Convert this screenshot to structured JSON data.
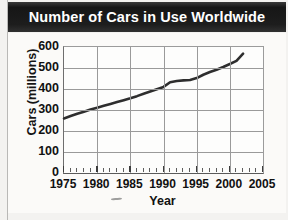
{
  "page": {
    "background_color": "#f3f2f0",
    "card_color": "#fbfaf8"
  },
  "banner": {
    "title": "Number of Cars in Use Worldwide",
    "background_color": "#1b1b1b",
    "text_color": "#ffffff"
  },
  "chart_data": {
    "type": "line",
    "title": "Number of Cars in Use Worldwide",
    "xlabel": "Year",
    "ylabel": "Cars (millions)",
    "xlim": [
      1975,
      2005
    ],
    "ylim": [
      0,
      600
    ],
    "xticks": [
      1975,
      1980,
      1985,
      1990,
      1995,
      2000,
      2005
    ],
    "xtick_labels": [
      "1975",
      "1980",
      "1985",
      "1990",
      "1995",
      "2000",
      "2005"
    ],
    "yticks": [
      0,
      100,
      200,
      300,
      400,
      500,
      600
    ],
    "ytick_labels": [
      "0",
      "100",
      "200",
      "300",
      "400",
      "500",
      "600"
    ],
    "minor_xtick_interval": 1,
    "grid": "both",
    "legend": "none",
    "line_color": "#2e2e2e",
    "line_width": 2.6,
    "series": [
      {
        "name": "Cars in use worldwide (millions)",
        "x": [
          1975,
          1976,
          1977,
          1978,
          1979,
          1980,
          1981,
          1982,
          1983,
          1984,
          1985,
          1986,
          1987,
          1988,
          1989,
          1990,
          1991,
          1992,
          1993,
          1994,
          1995,
          1996,
          1997,
          1998,
          1999,
          2000,
          2001,
          2002
        ],
        "values": [
          260,
          271,
          282,
          292,
          302,
          311,
          320,
          329,
          338,
          347,
          356,
          366,
          377,
          388,
          399,
          410,
          432,
          438,
          441,
          443,
          452,
          468,
          481,
          492,
          505,
          519,
          534,
          568
        ]
      }
    ],
    "annotations": []
  },
  "axis_titles": {
    "x": "Year",
    "y": "Cars (millions)"
  }
}
